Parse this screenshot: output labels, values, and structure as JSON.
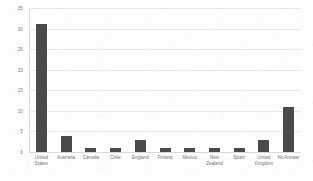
{
  "chart_data": {
    "type": "bar",
    "title": "",
    "subtitle": "",
    "xlabel": "",
    "ylabel": "",
    "categories": [
      "United States",
      "Australia",
      "Canada",
      "Chile",
      "England",
      "Finland",
      "Mexico",
      "New Zealand",
      "Spain",
      "United Kingdom",
      "No Answer"
    ],
    "category_lines": [
      [
        "United",
        "States"
      ],
      [
        "Australia"
      ],
      [
        "Canada"
      ],
      [
        "Chile"
      ],
      [
        "England"
      ],
      [
        "Finland"
      ],
      [
        "Mexico"
      ],
      [
        "New",
        "Zealand"
      ],
      [
        "Spain"
      ],
      [
        "United",
        "Kingdom"
      ],
      [
        "No Answer"
      ]
    ],
    "values": [
      31,
      4,
      1,
      1,
      3,
      1,
      1,
      1,
      1,
      3,
      11
    ],
    "ylim": [
      0,
      35
    ],
    "y_ticks": [
      0,
      5,
      10,
      15,
      20,
      25,
      30,
      35
    ],
    "y_tick_labels": [
      "0",
      "5",
      "10",
      "15",
      "20",
      "25",
      "30",
      "35"
    ],
    "grid": true,
    "grid_axis": "y",
    "legend": false,
    "legend_position": "none",
    "bar_color": "#4a4a4a",
    "gridline_color": "#e9e9ec",
    "axis_color": "#d8d8dc",
    "background_color": "#fdfdfd",
    "tick_label_color": "#7a7a7e"
  }
}
